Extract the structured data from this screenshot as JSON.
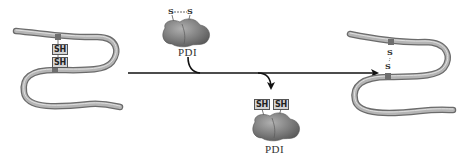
{
  "diagram": {
    "reactant_protein": {
      "groups": [
        "SH",
        "SH"
      ]
    },
    "pdi_oxidized": {
      "label": "PDI",
      "bond": {
        "left": "S",
        "right": "S"
      }
    },
    "pdi_reduced": {
      "label": "PDI",
      "groups": [
        "SH",
        "SH"
      ]
    },
    "product_protein": {
      "bond": {
        "top": "S",
        "bottom": "S"
      }
    },
    "colors": {
      "tube": "#a6a6a6",
      "tube_edge": "#6b6b6b",
      "cysteine": "#6e6e6e",
      "pdi": "#8a8a8a",
      "arrow": "#111111",
      "sh_box": "#d4d4d4"
    }
  }
}
